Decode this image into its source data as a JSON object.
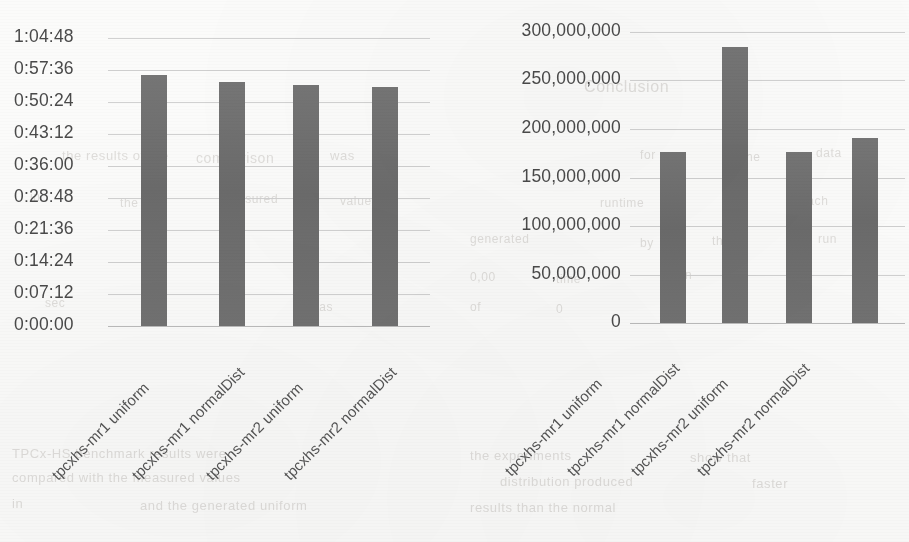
{
  "page": {
    "width": 909,
    "height": 542,
    "background_color": "#fbfbfa",
    "bar_color": "#6f6f6f",
    "gridline_color": "#cfcfcf",
    "text_color": "#4a4a4a"
  },
  "ghost_text": [
    {
      "text": "the results of the",
      "x": 62,
      "y": 148,
      "size": 13
    },
    {
      "text": "comparison",
      "x": 196,
      "y": 150,
      "size": 14
    },
    {
      "text": "was",
      "x": 330,
      "y": 148,
      "size": 13
    },
    {
      "text": "in",
      "x": 30,
      "y": 190,
      "size": 12
    },
    {
      "text": "the",
      "x": 120,
      "y": 196,
      "size": 12
    },
    {
      "text": "measured",
      "x": 220,
      "y": 192,
      "size": 12
    },
    {
      "text": "values",
      "x": 340,
      "y": 194,
      "size": 12
    },
    {
      "text": "Conclusion",
      "x": 584,
      "y": 78,
      "size": 16
    },
    {
      "text": "for",
      "x": 640,
      "y": 148,
      "size": 12
    },
    {
      "text": "the",
      "x": 742,
      "y": 150,
      "size": 12
    },
    {
      "text": "data",
      "x": 816,
      "y": 146,
      "size": 12
    },
    {
      "text": "runtime",
      "x": 600,
      "y": 196,
      "size": 12
    },
    {
      "text": "of",
      "x": 724,
      "y": 198,
      "size": 12
    },
    {
      "text": "each",
      "x": 800,
      "y": 194,
      "size": 12
    },
    {
      "text": "generated",
      "x": 470,
      "y": 232,
      "size": 12
    },
    {
      "text": "by",
      "x": 640,
      "y": 236,
      "size": 12
    },
    {
      "text": "the",
      "x": 712,
      "y": 234,
      "size": 12
    },
    {
      "text": "run",
      "x": 818,
      "y": 232,
      "size": 12
    },
    {
      "text": "0,00",
      "x": 470,
      "y": 270,
      "size": 12
    },
    {
      "text": "time",
      "x": 556,
      "y": 272,
      "size": 12
    },
    {
      "text": "taken",
      "x": 660,
      "y": 268,
      "size": 12
    },
    {
      "text": "by",
      "x": 790,
      "y": 270,
      "size": 12
    },
    {
      "text": "sec",
      "x": 45,
      "y": 296,
      "size": 12
    },
    {
      "text": "was",
      "x": 310,
      "y": 300,
      "size": 12
    },
    {
      "text": "of",
      "x": 470,
      "y": 300,
      "size": 12
    },
    {
      "text": "0",
      "x": 556,
      "y": 302,
      "size": 12
    },
    {
      "text": "the",
      "x": 660,
      "y": 304,
      "size": 12
    },
    {
      "text": "TPCx-HS benchmark results were",
      "x": 12,
      "y": 446,
      "size": 13
    },
    {
      "text": "compared with the measured values",
      "x": 12,
      "y": 470,
      "size": 13
    },
    {
      "text": "in",
      "x": 12,
      "y": 496,
      "size": 13
    },
    {
      "text": "and the generated uniform",
      "x": 140,
      "y": 498,
      "size": 13
    },
    {
      "text": "the experiments",
      "x": 470,
      "y": 448,
      "size": 13
    },
    {
      "text": "show that",
      "x": 690,
      "y": 450,
      "size": 13
    },
    {
      "text": "distribution produced",
      "x": 500,
      "y": 474,
      "size": 13
    },
    {
      "text": "faster",
      "x": 752,
      "y": 476,
      "size": 13
    },
    {
      "text": "results than the normal",
      "x": 470,
      "y": 500,
      "size": 13
    }
  ],
  "charts": [
    {
      "id": "chart-left",
      "chart_data": {
        "type": "bar",
        "title": "",
        "xlabel": "",
        "ylabel": "",
        "categories": [
          "tpcxhs-mr1 uniform",
          "tpcxhs-mr1 normalDist",
          "tpcxhs-mr2 uniform",
          "tpcxhs-mr2 normalDist"
        ],
        "values": [
          "0:56:30",
          "0:55:00",
          "0:54:10",
          "0:53:40"
        ],
        "values_seconds": [
          3390,
          3300,
          3250,
          3220
        ],
        "ytick_labels": [
          "1:04:48",
          "0:57:36",
          "0:50:24",
          "0:43:12",
          "0:36:00",
          "0:28:48",
          "0:21:36",
          "0:14:24",
          "0:07:12",
          "0:00:00"
        ],
        "ytick_seconds": [
          3888,
          3456,
          3024,
          2592,
          2160,
          1728,
          1296,
          864,
          432,
          0
        ],
        "ylim_seconds": [
          0,
          3888
        ],
        "grid": true,
        "legend": "none"
      }
    },
    {
      "id": "chart-right",
      "chart_data": {
        "type": "bar",
        "title": "",
        "xlabel": "",
        "ylabel": "",
        "categories": [
          "tpcxhs-mr1 uniform",
          "tpcxhs-mr1 normalDist",
          "tpcxhs-mr2 uniform",
          "tpcxhs-mr2 normalDist"
        ],
        "values": [
          176000000,
          285000000,
          176000000,
          191000000
        ],
        "ytick_labels": [
          "300,000,000",
          "250,000,000",
          "200,000,000",
          "150,000,000",
          "100,000,000",
          "50,000,000",
          "0"
        ],
        "ytick_values": [
          300000000,
          250000000,
          200000000,
          150000000,
          100000000,
          50000000,
          0
        ],
        "ylim": [
          0,
          300000000
        ],
        "grid": true,
        "legend": "none"
      }
    }
  ]
}
